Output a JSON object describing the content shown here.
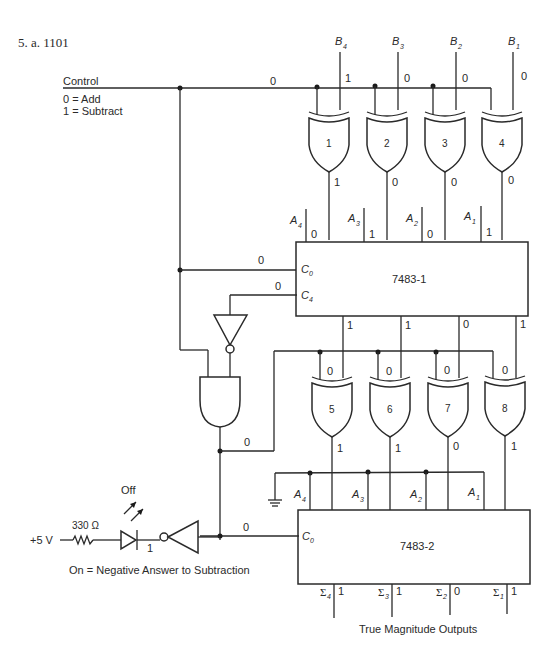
{
  "problem": {
    "label": "5. a. 1101"
  },
  "control": {
    "label": "Control",
    "value": "0",
    "legend": [
      "0 = Add",
      "1 = Subtract"
    ]
  },
  "b_inputs": [
    {
      "name": "B",
      "sub": "4",
      "value": "1"
    },
    {
      "name": "B",
      "sub": "3",
      "value": "0"
    },
    {
      "name": "B",
      "sub": "2",
      "value": "0"
    },
    {
      "name": "B",
      "sub": "1",
      "value": "0"
    }
  ],
  "xor_top": [
    {
      "label": "1",
      "output": "1"
    },
    {
      "label": "2",
      "output": "0"
    },
    {
      "label": "3",
      "output": "0"
    },
    {
      "label": "4",
      "output": "0"
    }
  ],
  "adder1": {
    "label": "7483-1",
    "c0_label": "C",
    "c0_sub": "0",
    "c0_value": "0",
    "c4_label": "C",
    "c4_sub": "4",
    "c4_value": "0",
    "a_inputs": [
      {
        "name": "A",
        "sub": "4",
        "value": "0"
      },
      {
        "name": "A",
        "sub": "3",
        "value": "1"
      },
      {
        "name": "A",
        "sub": "2",
        "value": "0"
      },
      {
        "name": "A",
        "sub": "1",
        "value": "1"
      }
    ],
    "sum_outputs": [
      "1",
      "1",
      "0",
      "1"
    ]
  },
  "xor_bottom": [
    {
      "label": "5",
      "in_value": "0",
      "output": "1"
    },
    {
      "label": "6",
      "in_value": "0",
      "output": "1"
    },
    {
      "label": "7",
      "in_value": "0",
      "output": "0"
    },
    {
      "label": "8",
      "in_value": "0",
      "output": "1"
    }
  ],
  "and_output": "0",
  "adder2": {
    "label": "7483-2",
    "c0_label": "C",
    "c0_sub": "0",
    "c0_value": "0",
    "a_inputs": [
      {
        "name": "A",
        "sub": "4"
      },
      {
        "name": "A",
        "sub": "3"
      },
      {
        "name": "A",
        "sub": "2"
      },
      {
        "name": "A",
        "sub": "1"
      }
    ],
    "sum_outputs": [
      {
        "name": "Σ",
        "sub": "4",
        "value": "1"
      },
      {
        "name": "Σ",
        "sub": "3",
        "value": "1"
      },
      {
        "name": "Σ",
        "sub": "2",
        "value": "0"
      },
      {
        "name": "Σ",
        "sub": "1",
        "value": "1"
      }
    ],
    "outputs_caption": "True Magnitude Outputs"
  },
  "led_circuit": {
    "supply": "+5 V",
    "resistor": "330 Ω",
    "led_state": "Off",
    "inverter_output": "1",
    "caption": "On = Negative Answer to Subtraction"
  }
}
